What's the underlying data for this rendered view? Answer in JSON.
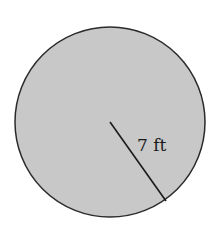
{
  "diagram": {
    "shape": "circle",
    "fill_color": "#c8c8c8",
    "stroke_color": "#2a2a2a",
    "radius_label": "7 ft",
    "radius_value": 7,
    "radius_unit": "ft"
  }
}
